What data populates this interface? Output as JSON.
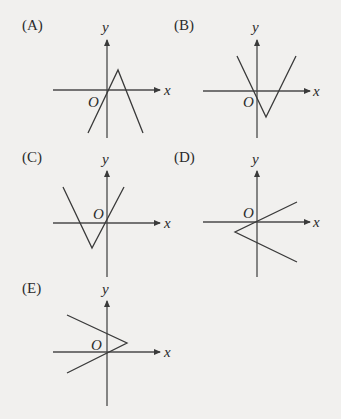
{
  "options": [
    {
      "label": "(A)",
      "x_label": "x",
      "y_label": "y",
      "origin_label": "O",
      "shape": "inverted V (peak above x-axis, right of origin)",
      "panel": {
        "ox": 107,
        "oy": 90,
        "lx": 26,
        "ly": 25
      },
      "segments": [
        [
          [
            88,
            133
          ],
          [
            118,
            70
          ]
        ],
        [
          [
            118,
            70
          ],
          [
            143,
            133
          ]
        ]
      ]
    },
    {
      "label": "(B)",
      "x_label": "x",
      "y_label": "y",
      "origin_label": "O",
      "shape": "V (vertex below x-axis, right of origin)",
      "panel": {
        "ox": 257,
        "oy": 91,
        "lx": 177,
        "ly": 25
      },
      "segments": [
        [
          [
            237,
            56
          ],
          [
            266,
            117
          ]
        ],
        [
          [
            266,
            117
          ],
          [
            296,
            56
          ]
        ]
      ]
    },
    {
      "label": "(C)",
      "x_label": "x",
      "y_label": "y",
      "origin_label": "O",
      "shape": "V (vertex below x-axis, left of origin)",
      "panel": {
        "ox": 107,
        "oy": 223,
        "lx": 26,
        "ly": 157
      },
      "segments": [
        [
          [
            63,
            187
          ],
          [
            92,
            248
          ]
        ],
        [
          [
            92,
            248
          ],
          [
            124,
            187
          ]
        ]
      ]
    },
    {
      "label": "(D)",
      "x_label": "x",
      "y_label": "y",
      "origin_label": "O",
      "shape": "< opening right (vertex left of origin, below x-axis)",
      "panel": {
        "ox": 257,
        "oy": 222,
        "lx": 177,
        "ly": 157
      },
      "segments": [
        [
          [
            235,
            232
          ],
          [
            297,
            202
          ]
        ],
        [
          [
            235,
            232
          ],
          [
            297,
            262
          ]
        ]
      ]
    },
    {
      "label": "(E)",
      "x_label": "x",
      "y_label": "y",
      "origin_label": "O",
      "shape": "> opening left (vertex right of origin, above x-axis)",
      "panel": {
        "ox": 107,
        "oy": 352,
        "lx": 26,
        "ly": 288
      },
      "segments": [
        [
          [
            67,
            315
          ],
          [
            127,
            343
          ]
        ],
        [
          [
            67,
            373
          ],
          [
            127,
            343
          ]
        ]
      ]
    }
  ]
}
